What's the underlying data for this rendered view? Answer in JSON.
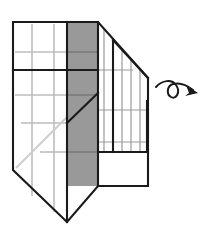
{
  "figure": {
    "type": "mental-rotation-diagram",
    "title": "",
    "background_color": "#ffffff",
    "stroke_color": "#1a1a1a",
    "grid_line_color": "#bdbdbd",
    "shaded_face_color": "#999999",
    "shaded_face_edge_color": "#7a7a7a",
    "white_face_color": "#ffffff",
    "canvas": {
      "width": 207,
      "height": 233
    },
    "parts": [
      {
        "name": "left-front-face",
        "shape": "polygon",
        "fill": "#ffffff",
        "points": "13,22 67,22 67,222 13,170"
      },
      {
        "name": "shaded-middle-face",
        "shape": "polygon",
        "fill": "#999999",
        "points": "67,22 98,22 98,186 67,186"
      },
      {
        "name": "right-top-face",
        "shape": "polygon",
        "fill": "#ffffff",
        "points": "98,22 148,78 148,152 98,152"
      },
      {
        "name": "right-bottom-face",
        "shape": "polygon",
        "fill": "#ffffff",
        "points": "98,152 148,152 148,186 98,186"
      },
      {
        "name": "inner-raised-block",
        "shape": "polygon",
        "fill": "#ffffff",
        "points": "113,40 148,78 148,152 113,152"
      }
    ],
    "grid_lines": {
      "left_face_vertical_x": [
        32,
        54
      ],
      "left_face_horizontal_y": [
        52,
        95,
        123,
        152
      ],
      "shaded_face_horizontal_y": [
        52,
        95,
        123,
        152
      ],
      "right_face_vertical_x": [
        104,
        113,
        122,
        131,
        140
      ],
      "right_face_horizontal_y": [
        70,
        110,
        142
      ]
    },
    "bold_edges": [
      {
        "name": "top-edge",
        "from": [
          13,
          22
        ],
        "to": [
          98,
          22
        ]
      },
      {
        "name": "upper-right-diagonal",
        "from": [
          98,
          22
        ],
        "to": [
          148,
          78
        ]
      },
      {
        "name": "right-vertical-edge",
        "from": [
          148,
          78
        ],
        "to": [
          148,
          186
        ]
      },
      {
        "name": "bottom-right-edge",
        "from": [
          148,
          186
        ],
        "to": [
          98,
          186
        ]
      },
      {
        "name": "shaded-bottom-edge",
        "from": [
          98,
          186
        ],
        "to": [
          67,
          186
        ]
      },
      {
        "name": "front-bottom-diagonal",
        "from": [
          67,
          222
        ],
        "to": [
          13,
          170
        ]
      },
      {
        "name": "left-vertical-edge",
        "from": [
          13,
          22
        ],
        "to": [
          13,
          170
        ]
      },
      {
        "name": "front-vertical-edge",
        "from": [
          67,
          22
        ],
        "to": [
          67,
          222
        ]
      },
      {
        "name": "mid-horizontal-divider",
        "from": [
          13,
          70
        ],
        "to": [
          98,
          70
        ]
      },
      {
        "name": "shaded-interior-diagonal",
        "from": [
          67,
          123
        ],
        "to": [
          98,
          93
        ]
      },
      {
        "name": "step-shelf-edge",
        "from": [
          98,
          152
        ],
        "to": [
          148,
          152
        ]
      },
      {
        "name": "inner-block-left-edge",
        "from": [
          113,
          40
        ],
        "to": [
          113,
          152
        ]
      },
      {
        "name": "inner-block-top-diagonal",
        "from": [
          113,
          40
        ],
        "to": [
          148,
          78
        ]
      }
    ],
    "light_diagonal": {
      "from": [
        16,
        168
      ],
      "to": [
        67,
        117
      ]
    }
  },
  "rotation_arrow": {
    "name": "rotation-arrow",
    "description": "curved looping rotation arrow indicating the object is turned",
    "loop_center": [
      176,
      92
    ],
    "loop_radius": 7,
    "tail_start": [
      156,
      88
    ],
    "arrowhead_tip": [
      197,
      92
    ],
    "color": "#1a1a1a"
  }
}
